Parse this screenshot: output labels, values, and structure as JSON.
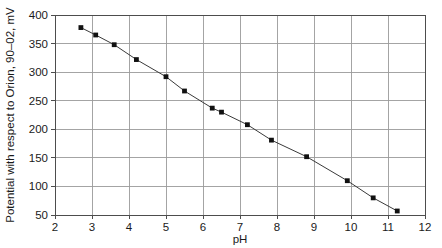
{
  "chart_data": {
    "type": "line",
    "title": "",
    "subtitle": "",
    "xlabel": "pH",
    "ylabel": "Potential with respect to Orion, 90–02, mV",
    "xlim": [
      2,
      12
    ],
    "ylim": [
      50,
      400
    ],
    "xticks": [
      "2",
      "3",
      "4",
      "5",
      "6",
      "7",
      "8",
      "9",
      "10",
      "11",
      "12"
    ],
    "yticks": [
      "50",
      "100",
      "150",
      "200",
      "250",
      "300",
      "350",
      "400"
    ],
    "xtick_values": [
      2,
      3,
      4,
      5,
      6,
      7,
      8,
      9,
      10,
      11,
      12
    ],
    "ytick_values": [
      50,
      100,
      150,
      200,
      250,
      300,
      350,
      400
    ],
    "grid": "both",
    "grid_color": "#9a9a9a",
    "legend": "none",
    "marker": "square",
    "marker_color": "#111111",
    "line_color": "#3a3a3a",
    "series": [
      {
        "name": "Electrode response",
        "x": [
          2.7,
          3.1,
          3.6,
          4.2,
          5.0,
          5.5,
          6.25,
          6.5,
          7.2,
          7.85,
          8.8,
          9.9,
          10.6,
          11.25
        ],
        "y": [
          378,
          365,
          348,
          322,
          292,
          267,
          237,
          230,
          208,
          181,
          152,
          110,
          80,
          57
        ]
      }
    ],
    "annotations": []
  },
  "figure": {
    "background": "#ffffff",
    "plot_left": 55,
    "plot_right": 425,
    "plot_top": 15,
    "plot_bottom": 215
  }
}
